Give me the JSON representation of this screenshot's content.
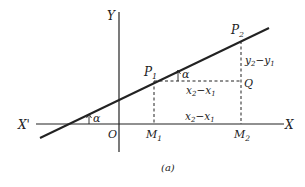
{
  "figure": {
    "caption": "(a)",
    "axes": {
      "x_label": "X",
      "x_neg_label": "X'",
      "y_label": "Y",
      "origin_label": "O"
    },
    "points": {
      "p1": {
        "main": "P",
        "sub": "1"
      },
      "p2": {
        "main": "P",
        "sub": "2"
      },
      "q": "Q",
      "m1": {
        "main": "M",
        "sub": "1"
      },
      "m2": {
        "main": "M",
        "sub": "2"
      }
    },
    "angle_label": "α",
    "angle_label_2": "α",
    "segments": {
      "dx_upper": {
        "a": "x",
        "asub": "2",
        "op": "−",
        "b": "x",
        "bsub": "1"
      },
      "dx_lower": {
        "a": "x",
        "asub": "2",
        "op": "−",
        "b": "x",
        "bsub": "1"
      },
      "dy": {
        "a": "y",
        "asub": "2",
        "op": "−",
        "b": "y",
        "bsub": "1"
      }
    },
    "colors": {
      "ink": "#222222",
      "background": "#ffffff"
    }
  }
}
